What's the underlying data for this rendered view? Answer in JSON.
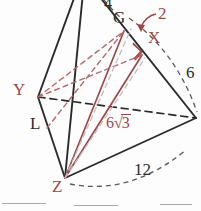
{
  "figure": {
    "colors": {
      "solid_edge": "#2b2b2b",
      "hidden_edge": "#2b2b2b",
      "accent_red": "#9e4848",
      "accent_red_light": "#b36a6a",
      "background": "#fdfdfd",
      "blank_rule": "#a8a8a8"
    },
    "vertex_labels": [
      {
        "id": "G",
        "text": "G",
        "color": "black",
        "x": 117,
        "y": 13
      },
      {
        "id": "X",
        "text": "X",
        "color": "red",
        "x": 152,
        "y": 33
      },
      {
        "id": "Y",
        "text": "Y",
        "color": "red",
        "x": 17,
        "y": 85
      },
      {
        "id": "L",
        "text": "L",
        "color": "black",
        "x": 33,
        "y": 119
      },
      {
        "id": "Z",
        "text": "Z",
        "color": "red",
        "x": 55,
        "y": 182
      }
    ],
    "measure_labels": [
      {
        "id": "four",
        "text": "4",
        "color": "black",
        "x": 107,
        "y": 0
      },
      {
        "id": "two",
        "text": "2",
        "color": "red",
        "x": 160,
        "y": 8
      },
      {
        "id": "six",
        "text": "6",
        "color": "black",
        "x": 188,
        "y": 68
      },
      {
        "id": "twelve",
        "text": "12",
        "color": "black",
        "x": 136,
        "y": 166
      }
    ],
    "radical_label": {
      "id": "six-root-three",
      "coefficient": "6",
      "radicand": "3",
      "color": "red",
      "x": 108,
      "y": 118
    },
    "annotations": {
      "right_angle_marker": "right-angle at X",
      "arrow": "curved arrow from label 2 to point X"
    }
  },
  "answer_blanks": [
    {
      "id": "blank-1",
      "x": 2,
      "y": 203,
      "width": 44
    },
    {
      "id": "blank-2",
      "x": 74,
      "y": 205,
      "width": 44
    },
    {
      "id": "blank-3",
      "x": 160,
      "y": 204,
      "width": 32
    }
  ]
}
